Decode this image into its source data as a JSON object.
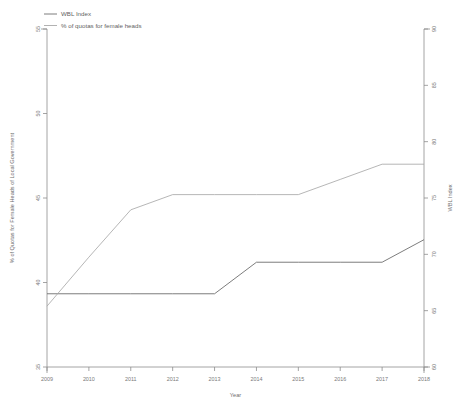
{
  "chart_data": {
    "type": "line",
    "title": "",
    "xlabel": "Year",
    "ylabel": "% of Quotas for Female Heads of Local Government",
    "y2label": "WBL Index",
    "x": [
      2009,
      2010,
      2011,
      2012,
      2013,
      2014,
      2015,
      2016,
      2017,
      2018
    ],
    "xticklabels": [
      "2009",
      "2010",
      "2011",
      "2012",
      "2013",
      "2014",
      "2015",
      "2016",
      "2017",
      "2018"
    ],
    "xlim": [
      2009,
      2018
    ],
    "ylim": [
      35,
      55
    ],
    "yticks": [
      35,
      40,
      45,
      50,
      55
    ],
    "yticklabels": [
      "35",
      "40",
      "45",
      "50",
      "55"
    ],
    "y2lim": [
      60,
      90
    ],
    "y2ticks": [
      60,
      65,
      70,
      75,
      80,
      85,
      90
    ],
    "y2ticklabels": [
      "60",
      "65",
      "70",
      "75",
      "80",
      "85",
      "90"
    ],
    "grid": false,
    "legend_position": "top-left",
    "series": [
      {
        "name": "WBL Index",
        "axis": "right",
        "color": "#6e6e6e",
        "values": [
          66.5,
          66.5,
          66.5,
          66.5,
          66.5,
          69.3,
          69.3,
          69.3,
          69.3,
          71.3
        ]
      },
      {
        "name": "% of quotas for female heads",
        "axis": "left",
        "color": "#a9a9a9",
        "values": [
          38.6,
          41.5,
          44.3,
          45.2,
          45.2,
          45.2,
          45.2,
          46.1,
          47.0,
          47.0
        ]
      }
    ]
  },
  "legend": {
    "items": [
      {
        "label": "WBL Index"
      },
      {
        "label": "% of quotas for female heads"
      }
    ]
  },
  "colors": {
    "wbl_line": "#6e6e6e",
    "quota_line": "#a9a9a9",
    "axis": "#8d8d8d",
    "text": "#7a7a7a",
    "background": "#ffffff"
  }
}
